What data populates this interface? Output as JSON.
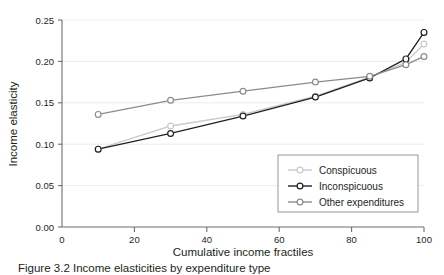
{
  "chart_data": {
    "type": "line",
    "title": "",
    "xlabel": "Cumulative income fractiles",
    "ylabel": "Income elasticity",
    "x": [
      10,
      30,
      50,
      70,
      85,
      95,
      100
    ],
    "xlim": [
      0,
      100
    ],
    "ylim": [
      0.0,
      0.25
    ],
    "xticks": [
      0,
      20,
      40,
      60,
      80,
      100
    ],
    "xtick_labels": [
      "0",
      "20",
      "40",
      "60",
      "80",
      "100"
    ],
    "yticks": [
      0.0,
      0.05,
      0.1,
      0.15,
      0.2,
      0.25
    ],
    "ytick_labels": [
      "0.00",
      "0.05",
      "0.10",
      "0.15",
      "0.20",
      "0.25"
    ],
    "grid": "horizontal",
    "legend_position": "lower-right",
    "series": [
      {
        "name": "Conspicuous",
        "color": "#c9c9c9",
        "marker": "circle-open",
        "values": [
          0.094,
          0.122,
          0.136,
          0.158,
          0.181,
          0.199,
          0.221
        ]
      },
      {
        "name": "Inconspicuous",
        "color": "#231f20",
        "marker": "circle-open",
        "values": [
          0.094,
          0.113,
          0.134,
          0.157,
          0.18,
          0.203,
          0.235
        ]
      },
      {
        "name": "Other expenditures",
        "color": "#8c8c8c",
        "marker": "circle-open",
        "values": [
          0.136,
          0.153,
          0.164,
          0.175,
          0.182,
          0.196,
          0.206
        ]
      }
    ]
  },
  "axes": {
    "ylabel": "Income elasticity",
    "xlabel": "Cumulative income fractiles",
    "ytick_labels": [
      "0.25",
      "0.20",
      "0.15",
      "0.10",
      "0.05",
      "0.00"
    ],
    "xtick_labels": [
      "0",
      "20",
      "40",
      "60",
      "80",
      "100"
    ]
  },
  "legend": {
    "items": [
      {
        "label": "Conspicuous",
        "color": "#c9c9c9"
      },
      {
        "label": "Inconspicuous",
        "color": "#231f20"
      },
      {
        "label": "Other expenditures",
        "color": "#8c8c8c"
      }
    ]
  },
  "caption": {
    "text": "Figure 3.2   Income elasticities by expenditure type"
  },
  "colors": {
    "axis": "#6e6e6e",
    "grid": "#ececec",
    "text": "#231f20"
  }
}
